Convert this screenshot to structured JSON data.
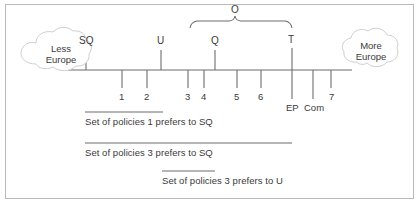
{
  "figure": {
    "background": "#ffffff",
    "border_color": "#b9b9b9",
    "ink_color": "#4a4a4a",
    "text_color": "#3a3a3a"
  },
  "axis": {
    "label_left": "Less\nEurope",
    "label_left_line1": "Less",
    "label_left_line2": "Europe",
    "label_right_line1": "More",
    "label_right_line2": "Europe",
    "x_start": 68,
    "x_end": 352,
    "y": 70
  },
  "brace": {
    "label": "O",
    "x_left": 190,
    "x_right": 292,
    "y": 24,
    "label_x": 234,
    "label_y": 8
  },
  "above_ticks": [
    {
      "label": "SQ",
      "x": 86
    },
    {
      "label": "U",
      "x": 161
    },
    {
      "label": "Q",
      "x": 215
    },
    {
      "label": "T",
      "x": 292
    }
  ],
  "below_ticks": [
    {
      "label": "1",
      "x": 122,
      "label_y": 93
    },
    {
      "label": "2",
      "x": 147,
      "label_y": 93
    },
    {
      "label": "3",
      "x": 188,
      "label_y": 93
    },
    {
      "label": "4",
      "x": 204,
      "label_y": 93
    },
    {
      "label": "5",
      "x": 237,
      "label_y": 93
    },
    {
      "label": "6",
      "x": 261,
      "label_y": 93
    },
    {
      "label": "EP",
      "x": 292,
      "label_y": 104
    },
    {
      "label": "Com",
      "x": 313,
      "label_y": 104
    },
    {
      "label": "7",
      "x": 331,
      "label_y": 93
    }
  ],
  "sets": [
    {
      "text": "Set of policies 1 prefers to SQ",
      "line_x_start": 85,
      "line_x_end": 163,
      "line_y": 112,
      "text_x": 85,
      "text_y": 118
    },
    {
      "text": "Set of policies 3 prefers to SQ",
      "line_x_start": 85,
      "line_x_end": 292,
      "line_y": 143,
      "text_x": 85,
      "text_y": 149
    },
    {
      "text": "Set of policies 3 prefers to U",
      "line_x_start": 162,
      "line_x_end": 215,
      "line_y": 171,
      "text_x": 162,
      "text_y": 177
    }
  ]
}
